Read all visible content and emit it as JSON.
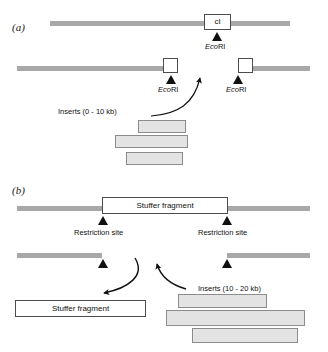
{
  "figure": {
    "background_color": "#ffffff",
    "bar_color": "#a8a8a8",
    "insert_fill": "#e3e3e3",
    "insert_stroke": "#8c8c8c",
    "box_stroke": "#4d4d4d",
    "ink_color": "#111111"
  },
  "panel_a": {
    "label": "(a)",
    "gene_box_label": "cI",
    "enzyme_labels": [
      {
        "prefix": "Eco",
        "suffix": "RI"
      },
      {
        "prefix": "Eco",
        "suffix": "RI"
      },
      {
        "prefix": "Eco",
        "suffix": "RI"
      }
    ],
    "inserts_label": "Inserts (0 - 10 kb)",
    "insert_count": 3
  },
  "panel_b": {
    "label": "(b)",
    "stuffer_label_top": "Stuffer fragment",
    "stuffer_label_bottom": "Stuffer fragment",
    "restriction_site_labels": [
      "Restriction site",
      "Restriction site"
    ],
    "inserts_label": "Inserts (10 - 20 kb)",
    "insert_count": 3
  }
}
